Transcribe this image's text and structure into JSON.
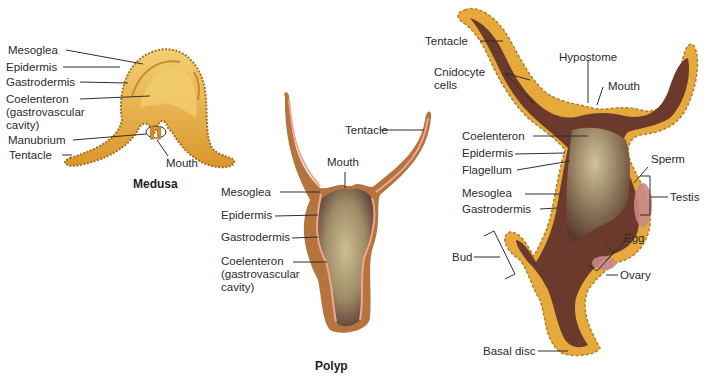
{
  "colors": {
    "medusa_body": "#e8a938",
    "medusa_light": "#f3cd6d",
    "polyp_outer": "#b5733e",
    "polyp_mesoglea": "#f0a78f",
    "cavity_dark": "#5c3b35",
    "cavity_light": "#c9b98d",
    "hydra_cells": "#e6a93b",
    "hydra_inner": "#6b3a2c",
    "gonad": "#c98787",
    "leader": "#2f2f2f"
  },
  "medusa": {
    "caption": "Medusa",
    "labels": {
      "mesoglea": "Mesoglea",
      "epidermis": "Epidermis",
      "gastrodermis": "Gastrodermis",
      "coelenteron_1": "Coelenteron",
      "coelenteron_2": "(gastrovascular",
      "coelenteron_3": "cavity)",
      "manubrium": "Manubrium",
      "tentacle": "Tentacle",
      "mouth": "Mouth"
    }
  },
  "polyp": {
    "caption": "Polyp",
    "labels": {
      "tentacle": "Tentacle",
      "mouth": "Mouth",
      "mesoglea": "Mesoglea",
      "epidermis": "Epidermis",
      "gastrodermis": "Gastrodermis",
      "coelenteron_1": "Coelenteron",
      "coelenteron_2": "(gastrovascular",
      "coelenteron_3": "cavity)"
    }
  },
  "hydra": {
    "labels": {
      "tentacle": "Tentacle",
      "cnidocyte_1": "Cnidocyte",
      "cnidocyte_2": "cells",
      "hypostome": "Hypostome",
      "mouth": "Mouth",
      "coelenteron": "Coelenteron",
      "epidermis": "Epidermis",
      "flagellum": "Flagellum",
      "mesoglea": "Mesoglea",
      "gastrodermis": "Gastrodermis",
      "sperm": "Sperm",
      "testis": "Testis",
      "egg": "Egg",
      "bud": "Bud",
      "ovary": "Ovary",
      "basal_disc": "Basal disc"
    }
  }
}
